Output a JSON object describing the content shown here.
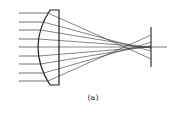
{
  "figure": {
    "caption": "(a)",
    "colors": {
      "stroke": "#333333",
      "background": "#ffffff"
    },
    "lens": {
      "flat_x": 59,
      "top_y": 10,
      "bottom_y": 85,
      "corner_x": 50,
      "apex_x": 38,
      "center_y": 47
    },
    "rays": {
      "start_x": 19,
      "heights": [
        13,
        22,
        30,
        39,
        47,
        56,
        64,
        73,
        81
      ]
    },
    "focus": {
      "paraxial_x": 151,
      "marginal_x": 122,
      "y": 47
    },
    "screen": {
      "x": 151,
      "top_y": 27,
      "bottom_y": 67
    },
    "axis": {
      "end_x": 167
    }
  }
}
